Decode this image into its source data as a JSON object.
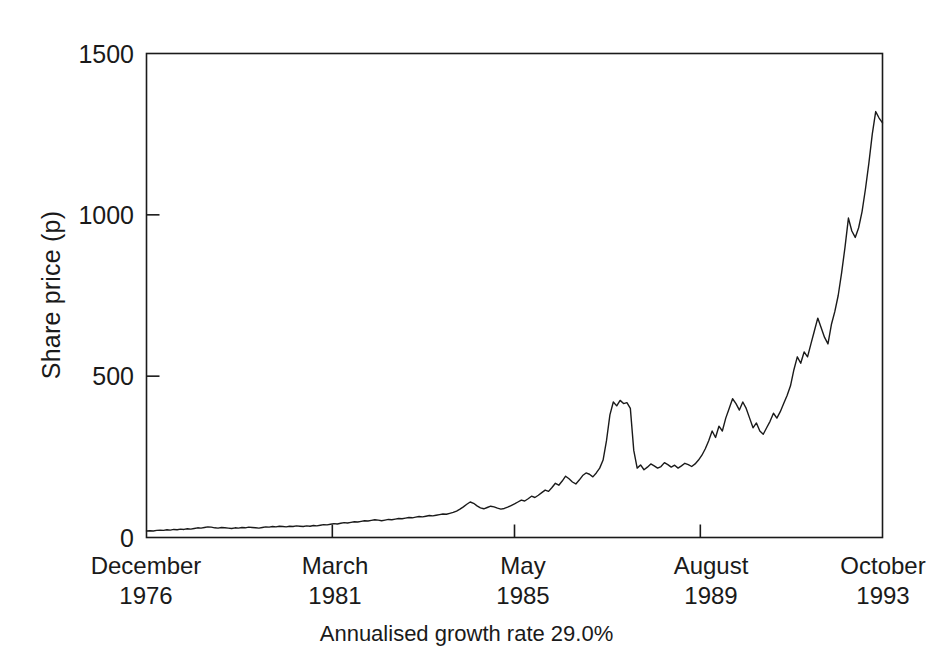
{
  "chart_data": {
    "type": "line",
    "title": "",
    "subtitle": "",
    "xlabel": "",
    "ylabel": "Share price (p)",
    "caption": "Annualised growth rate 29.0%",
    "ylim": [
      0,
      1500
    ],
    "yticks": [
      0,
      500,
      1000,
      1500
    ],
    "ytick_labels": [
      "0",
      "500",
      "1000",
      "1500"
    ],
    "xlim": [
      0,
      202
    ],
    "xticks": [
      0,
      51,
      101,
      152,
      202
    ],
    "xtick_labels": [
      {
        "month": "December",
        "year": "1976"
      },
      {
        "month": "March",
        "year": "1981"
      },
      {
        "month": "May",
        "year": "1985"
      },
      {
        "month": "August",
        "year": "1989"
      },
      {
        "month": "October",
        "year": "1993"
      }
    ],
    "grid": false,
    "legend": "none",
    "line_color": "#1a1a1a",
    "line_width": 1.4,
    "series": [
      {
        "name": "Share price",
        "x_unit": "months from December 1976",
        "values": [
          20,
          21,
          20,
          22,
          23,
          22,
          24,
          23,
          25,
          24,
          26,
          25,
          27,
          26,
          28,
          30,
          29,
          31,
          33,
          32,
          30,
          29,
          31,
          30,
          29,
          28,
          30,
          29,
          31,
          30,
          32,
          31,
          30,
          29,
          31,
          33,
          32,
          34,
          33,
          35,
          34,
          33,
          35,
          34,
          36,
          35,
          34,
          36,
          35,
          37,
          36,
          38,
          40,
          39,
          41,
          43,
          42,
          44,
          46,
          45,
          47,
          49,
          48,
          50,
          52,
          51,
          53,
          55,
          54,
          52,
          54,
          56,
          55,
          57,
          59,
          58,
          60,
          62,
          61,
          63,
          65,
          64,
          66,
          68,
          67,
          69,
          71,
          73,
          72,
          75,
          78,
          82,
          88,
          95,
          103,
          110,
          106,
          98,
          92,
          89,
          93,
          97,
          95,
          91,
          88,
          90,
          94,
          99,
          104,
          110,
          116,
          113,
          120,
          128,
          124,
          131,
          139,
          147,
          143,
          155,
          168,
          162,
          175,
          190,
          182,
          172,
          166,
          178,
          192,
          200,
          196,
          188,
          200,
          215,
          240,
          300,
          380,
          420,
          408,
          425,
          415,
          418,
          400,
          270,
          215,
          225,
          210,
          218,
          228,
          222,
          215,
          220,
          232,
          226,
          218,
          224,
          215,
          222,
          230,
          226,
          220,
          228,
          240,
          255,
          275,
          300,
          330,
          310,
          345,
          330,
          370,
          400,
          430,
          415,
          395,
          420,
          400,
          370,
          340,
          355,
          330,
          320,
          340,
          360,
          385,
          370,
          390,
          415,
          440,
          470,
          520,
          560,
          540,
          575,
          560,
          600,
          640,
          680,
          650,
          620,
          600,
          660,
          700,
          750,
          820,
          900,
          990,
          950,
          930,
          960,
          1010,
          1080,
          1160,
          1250,
          1320,
          1300,
          1285
        ]
      }
    ],
    "annotations": []
  },
  "axis": {
    "frame_color": "#1a1a1a",
    "tick_color": "#1a1a1a"
  }
}
